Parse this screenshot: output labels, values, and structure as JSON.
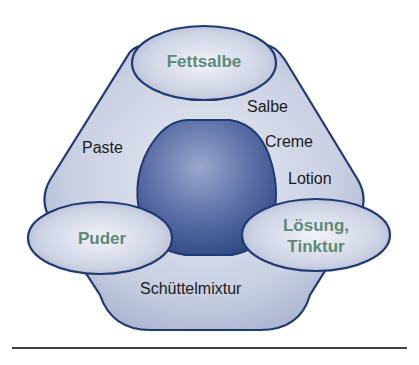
{
  "diagram": {
    "type": "formulation-hexagon",
    "center": {
      "shape": "sphere",
      "label": ""
    },
    "corner_ellipses": [
      {
        "id": "top",
        "label": "Fettsalbe"
      },
      {
        "id": "left",
        "label": "Puder"
      },
      {
        "id": "right",
        "label_line1": "Lösung,",
        "label_line2": "Tinktur"
      }
    ],
    "edge_labels": {
      "right_side": [
        "Salbe",
        "Creme",
        "Lotion"
      ],
      "left_side": [
        "Paste"
      ],
      "bottom_side": [
        "Schüttelmixtur"
      ]
    },
    "colors": {
      "outline": "#1f3a70",
      "hexagon_fill": "#c8d0e2",
      "sphere_dark": "#3d5591",
      "sphere_light": "#8a99c4",
      "accent_text": "#5c8a78",
      "text": "#1a1a1a",
      "rule": "#444444"
    }
  }
}
